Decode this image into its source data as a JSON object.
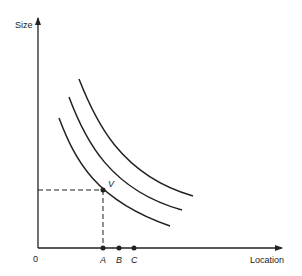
{
  "diagram": {
    "y_axis_label": "Size",
    "x_axis_label": "Location",
    "origin_label": "0",
    "point_label": "V",
    "x_points": [
      {
        "label": "A"
      },
      {
        "label": "B"
      },
      {
        "label": "C"
      }
    ],
    "curves": [
      {
        "name": "inner"
      },
      {
        "name": "middle"
      },
      {
        "name": "outer"
      }
    ],
    "line_color": "#222222"
  }
}
